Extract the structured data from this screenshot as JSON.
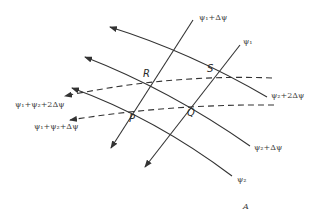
{
  "diagram": {
    "colors": {
      "line": "#333333",
      "text": "#3a3a3a"
    },
    "labels": {
      "psi1_plus": "ψ₁+Δψ",
      "psi1": "ψ₁",
      "psi2_plus2": "ψ₂+2Δψ",
      "psi2_plus": "ψ₂+Δψ",
      "psi2": "ψ₂",
      "sum_plus2": "ψ₁+ψ₂+2Δψ",
      "sum_plus": "ψ₁+ψ₂+Δψ",
      "corner": "A"
    },
    "points": {
      "P": "P",
      "Q": "Q",
      "R": "R",
      "S": "S"
    }
  }
}
